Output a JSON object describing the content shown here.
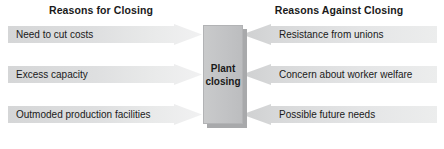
{
  "diagram": {
    "headings": {
      "left": "Reasons for Closing",
      "right": "Reasons Against Closing"
    },
    "center": {
      "label": "Plant\nclosing"
    },
    "left_items": [
      {
        "label": "Need to cut costs"
      },
      {
        "label": "Excess capacity"
      },
      {
        "label": "Outmoded production facilities"
      }
    ],
    "right_items": [
      {
        "label": "Resistance from unions"
      },
      {
        "label": "Concern about worker welfare"
      },
      {
        "label": "Possible future needs"
      }
    ],
    "colors": {
      "arrow_light": "#f1f1f2",
      "arrow_dark": "#d5d6d7",
      "center_box": "#c2c3c5",
      "center_box_shadow": "#a8a9ab",
      "text": "#1a1a1a",
      "background": "#ffffff"
    }
  }
}
